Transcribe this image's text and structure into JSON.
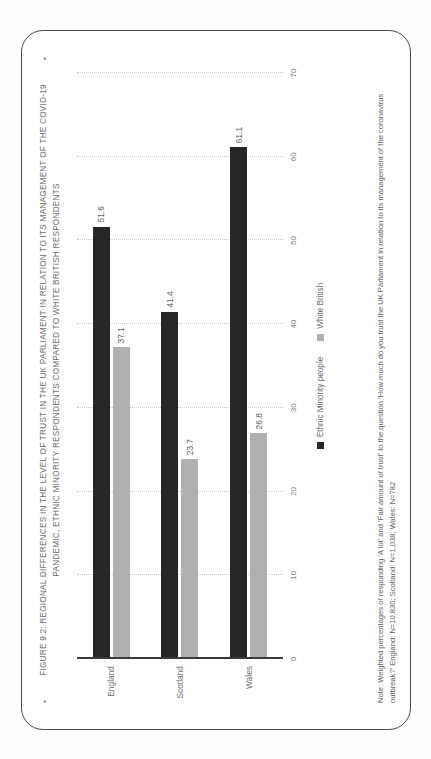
{
  "figure": {
    "bullet": "•",
    "title": "FIGURE 9.2: REGIONAL DIFFERENCES IN THE LEVEL OF TRUST IN THE UK PARLIAMENT IN RELATION TO ITS MANAGEMENT OF THE COVID-19 PANDEMIC, ETHNIC MINORITY RESPONDENTS COMPARED TO WHITE BRITISH  RESPONDENTS",
    "note": "Note: Weighted percentages of responding ‘A lot’ and ‘Fair amount of trust’ to the question ‘How much do you trust the UK Parliament in relation to its management of the coronavirus outbreak?’ England: N=10,830; Scotland: N=1,038; Wales: N=782"
  },
  "chart_data": {
    "type": "bar",
    "orientation": "vertical",
    "title": "FIGURE 9.2: REGIONAL DIFFERENCES IN THE LEVEL OF TRUST IN THE UK PARLIAMENT IN RELATION TO ITS MANAGEMENT OF THE COVID-19 PANDEMIC, ETHNIC MINORITY RESPONDENTS COMPARED TO WHITE BRITISH  RESPONDENTS",
    "xlabel": "",
    "ylabel": "",
    "ylim": [
      0,
      70
    ],
    "yticks": [
      0,
      10,
      20,
      30,
      40,
      50,
      60,
      70
    ],
    "ytick_labels": [
      "0",
      "10",
      "20",
      "30",
      "40",
      "50",
      "60",
      "70"
    ],
    "grid": true,
    "legend_position": "bottom",
    "categories": [
      "England",
      "Scotland",
      "Wales"
    ],
    "series": [
      {
        "name": "Ethnic Minority people",
        "color": "#262626",
        "values": [
          51.6,
          41.4,
          61.1
        ],
        "labels": [
          "51.6",
          "41.4",
          "61.1"
        ]
      },
      {
        "name": "White British",
        "color": "#b0b0b0",
        "values": [
          37.1,
          23.7,
          26.8
        ],
        "labels": [
          "37.1",
          "23.7",
          "26.8"
        ]
      }
    ]
  }
}
